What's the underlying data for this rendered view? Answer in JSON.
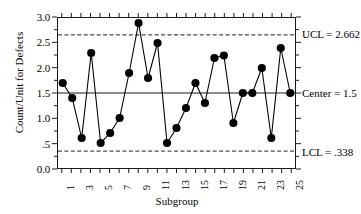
{
  "chart_data": {
    "type": "line",
    "title": "",
    "subtitle": "",
    "xlabel": "Subgroup",
    "ylabel": "Count/Unit for Defects",
    "xlim": [
      0.5,
      25.5
    ],
    "ylim": [
      0.0,
      3.0
    ],
    "grid": false,
    "legend_position": "none",
    "y_ticks": [
      0.0,
      0.5,
      1.0,
      1.5,
      2.0,
      2.5,
      3.0
    ],
    "y_tick_labels": [
      "0.0",
      ".5",
      "1.0",
      "1.5",
      "2.0",
      "2.5",
      "3.0"
    ],
    "x_ticks": [
      1,
      2,
      3,
      4,
      5,
      6,
      7,
      8,
      9,
      10,
      11,
      12,
      13,
      14,
      15,
      16,
      17,
      18,
      19,
      20,
      21,
      22,
      23,
      24,
      25
    ],
    "x_tick_labels": [
      "1",
      "",
      "3",
      "",
      "5",
      "",
      "7",
      "",
      "9",
      "",
      "11",
      "",
      "13",
      "",
      "15",
      "",
      "17",
      "",
      "19",
      "",
      "21",
      "",
      "23",
      "",
      "25"
    ],
    "x": [
      1,
      2,
      3,
      4,
      5,
      6,
      7,
      8,
      9,
      10,
      11,
      12,
      13,
      14,
      15,
      16,
      17,
      18,
      19,
      20,
      21,
      22,
      23,
      24,
      25
    ],
    "series": [
      {
        "name": "Count/Unit for Defects",
        "values": [
          1.7,
          1.4,
          0.6,
          2.3,
          0.5,
          0.7,
          1.0,
          1.9,
          2.9,
          1.8,
          2.5,
          0.5,
          0.8,
          1.2,
          1.7,
          1.3,
          2.2,
          2.25,
          0.9,
          1.5,
          1.5,
          2.0,
          0.6,
          2.4,
          1.5
        ],
        "marker": "circle",
        "color": "#000000"
      }
    ],
    "control_lines": [
      {
        "id": "ucl",
        "label": "UCL = 2.662",
        "value": 2.662,
        "style": "dashed"
      },
      {
        "id": "center",
        "label": "Center = 1.5",
        "value": 1.5,
        "style": "solid"
      },
      {
        "id": "lcl",
        "label": "LCL = .338",
        "value": 0.338,
        "style": "dashed"
      }
    ]
  }
}
